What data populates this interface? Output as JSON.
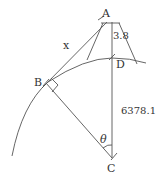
{
  "diagram": {
    "points": {
      "A": "A",
      "B": "B",
      "C": "C",
      "D": "D"
    },
    "labels": {
      "tangent_length": "x",
      "height": "3.8",
      "radius": "6378.1",
      "angle": "θ"
    },
    "colors": {
      "line": "#444444",
      "text": "#333333",
      "background": "#ffffff"
    }
  }
}
